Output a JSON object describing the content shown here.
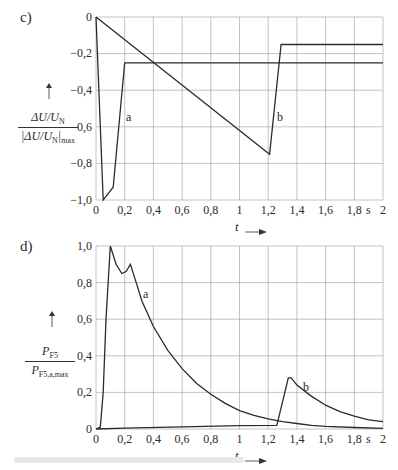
{
  "chart_data": [
    {
      "panel": "c)",
      "type": "line",
      "title": "",
      "xlabel": "t",
      "x_unit": "s",
      "ylabel": "ΔU/U_N / |ΔU/U_N|max",
      "xlim": [
        0,
        2
      ],
      "ylim": [
        -1.0,
        0
      ],
      "grid": true,
      "x_ticks": [
        "0",
        "0,2",
        "0,4",
        "0,6",
        "0,8",
        "1",
        "1,2",
        "1,4",
        "1,6",
        "1,8",
        "2"
      ],
      "y_ticks": [
        "0",
        "-0,2",
        "-0,4",
        "-0,6",
        "-0,8",
        "-1,0"
      ],
      "series": [
        {
          "name": "a",
          "points": [
            [
              0,
              0
            ],
            [
              0.05,
              -1.0
            ],
            [
              0.12,
              -0.93
            ],
            [
              0.2,
              -0.25
            ],
            [
              2.0,
              -0.25
            ]
          ]
        },
        {
          "name": "b",
          "points": [
            [
              0,
              0
            ],
            [
              1.21,
              -0.75
            ],
            [
              1.29,
              -0.15
            ],
            [
              2.0,
              -0.15
            ]
          ]
        }
      ],
      "annotations": [
        {
          "text": "a",
          "x": 0.27,
          "y": -0.55
        },
        {
          "text": "b",
          "x": 1.27,
          "y": -0.55
        }
      ]
    },
    {
      "panel": "d)",
      "type": "line",
      "title": "",
      "xlabel": "t",
      "x_unit": "s",
      "ylabel": "P_F5 / P_F5,a,max",
      "xlim": [
        0,
        2
      ],
      "ylim": [
        0,
        1.0
      ],
      "grid": true,
      "x_ticks": [
        "0",
        "0,2",
        "0,4",
        "0,6",
        "0,8",
        "1",
        "1,2",
        "1,4",
        "1,6",
        "1,8",
        "s",
        "2"
      ],
      "y_ticks": [
        "1,0",
        "0,8",
        "0,6",
        "0,4",
        "0,2",
        "0"
      ],
      "series": [
        {
          "name": "a",
          "points": [
            [
              0,
              0
            ],
            [
              0.03,
              0.01
            ],
            [
              0.05,
              0.2
            ],
            [
              0.07,
              0.6
            ],
            [
              0.1,
              1.0
            ],
            [
              0.14,
              0.9
            ],
            [
              0.18,
              0.85
            ],
            [
              0.21,
              0.86
            ],
            [
              0.24,
              0.9
            ],
            [
              0.28,
              0.8
            ],
            [
              0.32,
              0.7
            ],
            [
              0.4,
              0.56
            ],
            [
              0.5,
              0.43
            ],
            [
              0.6,
              0.33
            ],
            [
              0.7,
              0.25
            ],
            [
              0.8,
              0.19
            ],
            [
              0.9,
              0.14
            ],
            [
              1.0,
              0.1
            ],
            [
              1.1,
              0.075
            ],
            [
              1.2,
              0.055
            ],
            [
              1.3,
              0.04
            ],
            [
              1.4,
              0.03
            ],
            [
              1.5,
              0.02
            ],
            [
              1.6,
              0.015
            ],
            [
              1.8,
              0.008
            ],
            [
              2.0,
              0.004
            ]
          ]
        },
        {
          "name": "b",
          "points": [
            [
              0,
              0
            ],
            [
              0.2,
              0.005
            ],
            [
              0.6,
              0.012
            ],
            [
              1.0,
              0.018
            ],
            [
              1.26,
              0.02
            ],
            [
              1.3,
              0.15
            ],
            [
              1.34,
              0.28
            ],
            [
              1.36,
              0.28
            ],
            [
              1.4,
              0.24
            ],
            [
              1.5,
              0.18
            ],
            [
              1.6,
              0.13
            ],
            [
              1.7,
              0.095
            ],
            [
              1.8,
              0.07
            ],
            [
              1.9,
              0.05
            ],
            [
              2.0,
              0.04
            ]
          ]
        }
      ],
      "annotations": [
        {
          "text": "a",
          "x": 0.33,
          "y": 0.77
        },
        {
          "text": "b",
          "x": 1.45,
          "y": 0.26
        }
      ]
    }
  ],
  "panels": {
    "c": {
      "label": "c)",
      "ylabel_num": "ΔU/U",
      "ylabel_num_sub": "N",
      "ylabel_den": "|ΔU/U",
      "ylabel_den_sub": "N",
      "ylabel_den_tail": "|",
      "ylabel_den_sub2": "max",
      "x_ticks": [
        "0",
        "0,2",
        "0,4",
        "0,6",
        "0,8",
        "1",
        "1,2",
        "1,4",
        "1,6",
        "1,8",
        "2"
      ],
      "y_ticks": [
        "0",
        "−0,2",
        "−0,4",
        "−0,6",
        "−0,8",
        "−1,0"
      ],
      "unit": "s",
      "xlabel": "t",
      "curve_a": "a",
      "curve_b": "b"
    },
    "d": {
      "label": "d)",
      "ylabel_num": "P",
      "ylabel_num_sub": "F5",
      "ylabel_den": "P",
      "ylabel_den_sub": "F5,a,max",
      "x_ticks": [
        "0",
        "0,2",
        "0,4",
        "0,6",
        "0,8",
        "1",
        "1,2",
        "1,4",
        "1,6",
        "1,8",
        "2"
      ],
      "y_ticks": [
        "1,0",
        "0,8",
        "0,6",
        "0,4",
        "0,2",
        "0"
      ],
      "unit": "s",
      "xlabel": "t",
      "curve_a": "a",
      "curve_b": "b"
    }
  },
  "icons": {
    "up_arrow": "▲",
    "right_arrow": "⟶"
  }
}
